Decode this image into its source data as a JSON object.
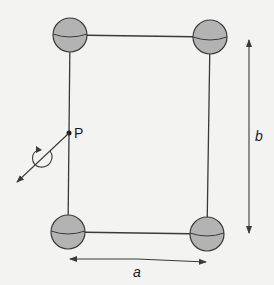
{
  "diagram": {
    "colors": {
      "background": "#f3f3f1",
      "line": "#3a3a3a",
      "sphere_fill": "#b3b3b3",
      "sphere_stroke": "#3a3a3a"
    },
    "labels": {
      "point": "P",
      "width": "a",
      "height": "b"
    },
    "spheres": [
      {
        "name": "top-left",
        "cx": 70,
        "cy": 35,
        "r": 17
      },
      {
        "name": "top-right",
        "cx": 210,
        "cy": 37,
        "r": 17
      },
      {
        "name": "bottom-left",
        "cx": 68,
        "cy": 232,
        "r": 17
      },
      {
        "name": "bottom-right",
        "cx": 207,
        "cy": 234,
        "r": 17
      }
    ],
    "dimension_arrows": [
      {
        "label": "a",
        "orientation": "horizontal"
      },
      {
        "label": "b",
        "orientation": "vertical"
      }
    ],
    "rotation_axis": {
      "through": "P",
      "direction": "down-left diagonal",
      "rotation_indicator": "circular arrow"
    }
  }
}
